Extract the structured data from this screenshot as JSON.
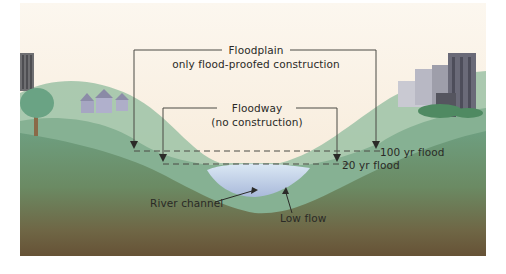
{
  "diagram": {
    "type": "cross-section",
    "labels": {
      "floodplain_title": "Floodplain",
      "floodplain_sub": "only flood-proofed construction",
      "floodway_title": "Floodway",
      "floodway_sub": "(no construction)",
      "flood_100": "100 yr flood",
      "flood_20": "20 yr flood",
      "river_channel": "River channel",
      "low_flow": "Low flow"
    },
    "colors": {
      "sky": "#f8efe2",
      "hill_light": "#8fb89a",
      "hill_mid": "#6fa184",
      "ground_top": "#5e8f70",
      "ground_bottom": "#6a5638",
      "water": "#c9dcef",
      "line": "#4a4a44"
    }
  }
}
